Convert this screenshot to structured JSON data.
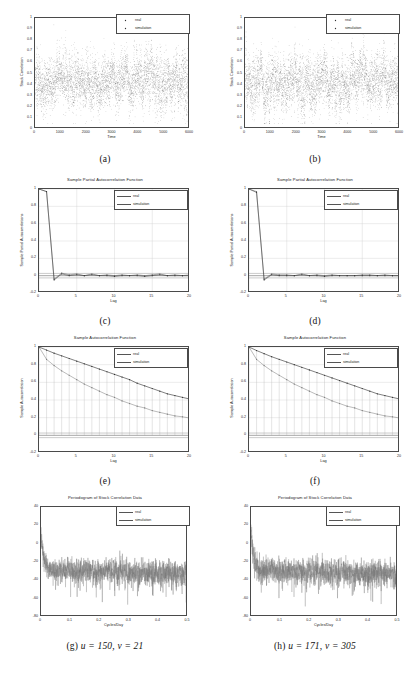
{
  "figure": {
    "legend_entries": [
      "real",
      "simulation"
    ],
    "colors": {
      "real": "#4a4a4a",
      "simulation": "#6b6b6b",
      "axis": "#4a4a4a",
      "grid": "#c9c9c9",
      "background": "#ffffff"
    }
  },
  "panels": [
    {
      "caption": "(a)",
      "title": "",
      "xlabel": "Time",
      "ylabel": "Stock Correlation",
      "xticks": [
        "0",
        "1000",
        "2000",
        "3000",
        "4000",
        "5000",
        "6000"
      ],
      "yticks": [
        "0",
        "0.1",
        "0.2",
        "0.3",
        "0.4",
        "0.5",
        "0.6",
        "0.7",
        "0.8",
        "0.9",
        "1"
      ],
      "legend": [
        "real",
        "simulation"
      ]
    },
    {
      "caption": "(b)",
      "title": "",
      "xlabel": "Time",
      "ylabel": "Stock Correlation",
      "xticks": [
        "0",
        "1000",
        "2000",
        "3000",
        "4000",
        "5000",
        "6000"
      ],
      "yticks": [
        "0",
        "0.1",
        "0.2",
        "0.3",
        "0.4",
        "0.5",
        "0.6",
        "0.7",
        "0.8",
        "0.9",
        "1"
      ],
      "legend": [
        "real",
        "simulation"
      ]
    },
    {
      "caption": "(c)",
      "title": "Sample Partial Autocorrelation Function",
      "xlabel": "Lag",
      "ylabel": "Sample Partial Autocorrelations",
      "xticks": [
        "0",
        "5",
        "10",
        "15",
        "20"
      ],
      "yticks": [
        "-0.2",
        "0",
        "0.2",
        "0.4",
        "0.6",
        "0.8",
        "1"
      ],
      "legend": [
        "real",
        "simulation"
      ]
    },
    {
      "caption": "(d)",
      "title": "Sample Partial Autocorrelation Function",
      "xlabel": "Lag",
      "ylabel": "Sample Partial Autocorrelations",
      "xticks": [
        "0",
        "5",
        "10",
        "15",
        "20"
      ],
      "yticks": [
        "-0.2",
        "0",
        "0.2",
        "0.4",
        "0.6",
        "0.8",
        "1"
      ],
      "legend": [
        "real",
        "simulation"
      ]
    },
    {
      "caption": "(e)",
      "title": "Sample Autocorrelation Function",
      "xlabel": "Lag",
      "ylabel": "Sample Autocorrelation",
      "xticks": [
        "0",
        "5",
        "10",
        "15",
        "20"
      ],
      "yticks": [
        "-0.2",
        "0",
        "0.2",
        "0.4",
        "0.6",
        "0.8",
        "1"
      ],
      "legend": [
        "real",
        "simulation"
      ]
    },
    {
      "caption": "(f)",
      "title": "Sample Autocorrelation Function",
      "xlabel": "Lag",
      "ylabel": "Sample Autocorrelation",
      "xticks": [
        "0",
        "5",
        "10",
        "15",
        "20"
      ],
      "yticks": [
        "-0.2",
        "0",
        "0.2",
        "0.4",
        "0.6",
        "0.8",
        "1"
      ],
      "legend": [
        "real",
        "simulation"
      ]
    },
    {
      "caption": "(g) u = 150, v = 21",
      "caption_prefix": "(g)",
      "caption_math": "u = 150, v = 21",
      "title": "Periodogram of Stock Correlation Data",
      "xlabel": "Cycles/Day",
      "ylabel": "",
      "xticks": [
        "0",
        "0.1",
        "0.2",
        "0.3",
        "0.4",
        "0.5"
      ],
      "yticks": [
        "-80",
        "-60",
        "-40",
        "-20",
        "0",
        "20",
        "40"
      ],
      "legend": [
        "real",
        "simulation"
      ]
    },
    {
      "caption": "(h) u = 171, v = 305",
      "caption_prefix": "(h)",
      "caption_math": "u = 171, v = 305",
      "title": "Periodogram of Stock Correlation Data",
      "xlabel": "Cycles/Day",
      "ylabel": "",
      "xticks": [
        "0",
        "0.1",
        "0.2",
        "0.3",
        "0.4",
        "0.5"
      ],
      "yticks": [
        "-80",
        "-60",
        "-40",
        "-20",
        "0",
        "20",
        "40"
      ],
      "legend": [
        "real",
        "simulation"
      ]
    }
  ],
  "chart_data": [
    {
      "type": "scatter",
      "panel": "a",
      "title": "",
      "xlabel": "Time",
      "ylabel": "Stock Correlation",
      "xlim": [
        0,
        6000
      ],
      "ylim": [
        0,
        1
      ],
      "grid": false,
      "legend": [
        "real",
        "simulation"
      ],
      "legend_position": "top-right",
      "description": "Dense overlapping scatter of two series of ~6000 daily stock correlation values; both series fluctuate about a mean near 0.43 with most points between 0.2 and 0.75 and occasional spikes toward 0.9.",
      "series": [
        {
          "name": "real",
          "mean": 0.43,
          "min": 0.05,
          "max": 0.95,
          "n": 6000
        },
        {
          "name": "simulation",
          "mean": 0.43,
          "min": 0.05,
          "max": 0.92,
          "n": 6000
        }
      ]
    },
    {
      "type": "scatter",
      "panel": "b",
      "title": "",
      "xlabel": "Time",
      "ylabel": "Stock Correlation",
      "xlim": [
        0,
        6000
      ],
      "ylim": [
        0,
        1
      ],
      "grid": false,
      "legend": [
        "real",
        "simulation"
      ],
      "legend_position": "top-right",
      "description": "Dense overlapping scatter of two series of ~6000 daily stock correlation values; both series fluctuate about a mean near 0.43 with most points between 0.2 and 0.75.",
      "series": [
        {
          "name": "real",
          "mean": 0.43,
          "min": 0.05,
          "max": 0.95,
          "n": 6000
        },
        {
          "name": "simulation",
          "mean": 0.43,
          "min": 0.05,
          "max": 0.93,
          "n": 6000
        }
      ]
    },
    {
      "type": "line",
      "panel": "c",
      "title": "Sample Partial Autocorrelation Function",
      "xlabel": "Lag",
      "ylabel": "Sample Partial Autocorrelations",
      "xlim": [
        0,
        20
      ],
      "ylim": [
        -0.2,
        1
      ],
      "grid": true,
      "legend": [
        "real",
        "simulation"
      ],
      "legend_position": "top-right",
      "x": [
        0,
        1,
        2,
        3,
        4,
        5,
        6,
        7,
        8,
        9,
        10,
        11,
        12,
        13,
        14,
        15,
        16,
        17,
        18,
        19,
        20
      ],
      "series": [
        {
          "name": "real",
          "values": [
            1,
            0.97,
            -0.04,
            0.03,
            0.01,
            0.02,
            0.0,
            0.02,
            0.0,
            0.01,
            0.0,
            0.01,
            0.0,
            0.01,
            0.0,
            0.01,
            0.02,
            0.0,
            0.01,
            0.0,
            0.01
          ]
        },
        {
          "name": "simulation",
          "values": [
            1,
            0.97,
            -0.05,
            0.02,
            0.0,
            0.01,
            0.0,
            0.01,
            0.0,
            0.0,
            -0.01,
            0.0,
            0.0,
            0.0,
            -0.01,
            0.0,
            0.01,
            0.0,
            0.0,
            0.0,
            0.0
          ]
        }
      ],
      "confidence_bounds": [
        0.026,
        -0.026
      ]
    },
    {
      "type": "line",
      "panel": "d",
      "title": "Sample Partial Autocorrelation Function",
      "xlabel": "Lag",
      "ylabel": "Sample Partial Autocorrelations",
      "xlim": [
        0,
        20
      ],
      "ylim": [
        -0.2,
        1
      ],
      "grid": true,
      "legend": [
        "real",
        "simulation"
      ],
      "legend_position": "top-right",
      "x": [
        0,
        1,
        2,
        3,
        4,
        5,
        6,
        7,
        8,
        9,
        10,
        11,
        12,
        13,
        14,
        15,
        16,
        17,
        18,
        19,
        20
      ],
      "series": [
        {
          "name": "real",
          "values": [
            1,
            0.97,
            -0.04,
            0.02,
            0.01,
            0.01,
            0.0,
            0.02,
            0.0,
            0.01,
            0.0,
            0.01,
            0.0,
            0.0,
            0.0,
            0.01,
            0.01,
            0.0,
            0.01,
            0.0,
            0.0
          ]
        },
        {
          "name": "simulation",
          "values": [
            1,
            0.96,
            -0.05,
            0.01,
            0.0,
            0.0,
            0.0,
            0.01,
            0.0,
            0.0,
            -0.01,
            0.0,
            0.0,
            0.0,
            0.0,
            0.0,
            0.0,
            0.0,
            0.0,
            0.0,
            0.0
          ]
        }
      ],
      "confidence_bounds": [
        0.026,
        -0.026
      ]
    },
    {
      "type": "line",
      "panel": "e",
      "title": "Sample Autocorrelation Function",
      "xlabel": "Lag",
      "ylabel": "Sample Autocorrelation",
      "xlim": [
        0,
        20
      ],
      "ylim": [
        -0.2,
        1
      ],
      "grid": true,
      "legend": [
        "real",
        "simulation"
      ],
      "legend_position": "top-right",
      "x": [
        0,
        1,
        2,
        3,
        4,
        5,
        6,
        7,
        8,
        9,
        10,
        11,
        12,
        13,
        14,
        15,
        16,
        17,
        18,
        19,
        20
      ],
      "series": [
        {
          "name": "real",
          "values": [
            1.0,
            0.86,
            0.79,
            0.73,
            0.68,
            0.63,
            0.58,
            0.54,
            0.5,
            0.46,
            0.43,
            0.39,
            0.36,
            0.33,
            0.31,
            0.28,
            0.26,
            0.24,
            0.22,
            0.21,
            0.195
          ]
        },
        {
          "name": "simulation",
          "values": [
            1.0,
            0.965,
            0.93,
            0.9,
            0.87,
            0.84,
            0.81,
            0.78,
            0.75,
            0.72,
            0.69,
            0.66,
            0.63,
            0.59,
            0.56,
            0.53,
            0.5,
            0.47,
            0.45,
            0.43,
            0.41
          ]
        }
      ],
      "confidence_bounds": [
        0.026,
        -0.026
      ]
    },
    {
      "type": "line",
      "panel": "f",
      "title": "Sample Autocorrelation Function",
      "xlabel": "Lag",
      "ylabel": "Sample Autocorrelation",
      "xlim": [
        0,
        20
      ],
      "ylim": [
        -0.2,
        1
      ],
      "grid": true,
      "legend": [
        "real",
        "simulation"
      ],
      "legend_position": "top-right",
      "x": [
        0,
        1,
        2,
        3,
        4,
        5,
        6,
        7,
        8,
        9,
        10,
        11,
        12,
        13,
        14,
        15,
        16,
        17,
        18,
        19,
        20
      ],
      "series": [
        {
          "name": "real",
          "values": [
            1.0,
            0.86,
            0.79,
            0.73,
            0.68,
            0.63,
            0.58,
            0.54,
            0.5,
            0.46,
            0.43,
            0.39,
            0.36,
            0.33,
            0.31,
            0.28,
            0.26,
            0.24,
            0.22,
            0.21,
            0.195
          ]
        },
        {
          "name": "simulation",
          "values": [
            1.0,
            0.96,
            0.925,
            0.89,
            0.86,
            0.83,
            0.8,
            0.77,
            0.74,
            0.71,
            0.68,
            0.65,
            0.62,
            0.59,
            0.56,
            0.53,
            0.5,
            0.47,
            0.45,
            0.43,
            0.41
          ]
        }
      ],
      "confidence_bounds": [
        0.026,
        -0.026
      ]
    },
    {
      "type": "line",
      "panel": "g",
      "title": "Periodogram of Stock Correlation Data",
      "xlabel": "Cycles/Day",
      "ylabel": "",
      "xlim": [
        0,
        0.5
      ],
      "ylim": [
        -80,
        40
      ],
      "grid": false,
      "legend": [
        "real",
        "simulation"
      ],
      "legend_position": "top-right",
      "description": "Log-power periodogram in dB. Power peaks near 15 dB at frequency 0, decays steeply to about -25 dB by 0.05 Cycles/Day, then stays roughly flat near -28 dB with dense noise excursions down to about -65 dB across the band up to 0.5.",
      "series": [
        {
          "name": "real",
          "peak_db": 15,
          "plateau_db": -28,
          "noise_floor_db": -65
        },
        {
          "name": "simulation",
          "peak_db": 14,
          "plateau_db": -29,
          "noise_floor_db": -68
        }
      ]
    },
    {
      "type": "line",
      "panel": "h",
      "title": "Periodogram of Stock Correlation Data",
      "xlabel": "Cycles/Day",
      "ylabel": "",
      "xlim": [
        0,
        0.5
      ],
      "ylim": [
        -80,
        40
      ],
      "grid": false,
      "legend": [
        "real",
        "simulation"
      ],
      "legend_position": "top-right",
      "description": "Log-power periodogram in dB. Power peaks near 15 dB at frequency 0, decays steeply to about -25 dB by 0.05 Cycles/Day, then stays roughly flat near -28 dB with dense noise excursions down to about -65 dB across the band up to 0.5.",
      "series": [
        {
          "name": "real",
          "peak_db": 15,
          "plateau_db": -28,
          "noise_floor_db": -65
        },
        {
          "name": "simulation",
          "peak_db": 14,
          "plateau_db": -29,
          "noise_floor_db": -68
        }
      ]
    }
  ]
}
